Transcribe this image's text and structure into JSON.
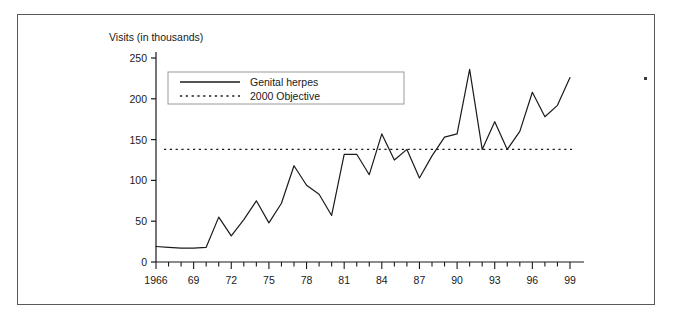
{
  "figure": {
    "background_color": "#ffffff",
    "frame_color": "#58595b",
    "line_color": "#1a1a1a"
  },
  "chart_data": {
    "type": "line",
    "title": "",
    "ylabel": "Visits (in thousands)",
    "xlabel": "",
    "ylim": [
      0,
      250
    ],
    "yticks": [
      0,
      50,
      100,
      150,
      200,
      250
    ],
    "xlim": [
      1966,
      1999
    ],
    "xticks": [
      1966,
      1969,
      1972,
      1975,
      1978,
      1981,
      1984,
      1987,
      1990,
      1993,
      1996,
      1999
    ],
    "xtick_labels": [
      "1966",
      "69",
      "72",
      "75",
      "78",
      "81",
      "84",
      "87",
      "90",
      "93",
      "96",
      "99"
    ],
    "minor_xticks_every": 1,
    "grid": false,
    "legend_position": "upper-left-inside",
    "x": [
      1966,
      1967,
      1968,
      1969,
      1970,
      1971,
      1972,
      1973,
      1974,
      1975,
      1976,
      1977,
      1978,
      1979,
      1980,
      1981,
      1982,
      1983,
      1984,
      1985,
      1986,
      1987,
      1988,
      1989,
      1990,
      1991,
      1992,
      1993,
      1994,
      1995,
      1996,
      1997,
      1998,
      1999
    ],
    "series": [
      {
        "name": "Genital herpes",
        "style": "solid",
        "values": [
          19,
          18,
          17,
          17,
          18,
          55,
          32,
          52,
          75,
          48,
          72,
          118,
          94,
          83,
          57,
          132,
          132,
          107,
          157,
          125,
          138,
          103,
          130,
          153,
          157,
          236,
          138,
          172,
          138,
          160,
          208,
          178,
          192,
          226
        ]
      },
      {
        "name": "2000 Objective",
        "style": "dotted",
        "constant_value": 138,
        "values": [
          138,
          138,
          138,
          138,
          138,
          138,
          138,
          138,
          138,
          138,
          138,
          138,
          138,
          138,
          138,
          138,
          138,
          138,
          138,
          138,
          138,
          138,
          138,
          138,
          138,
          138,
          138,
          138,
          138,
          138,
          138,
          138,
          138,
          138
        ]
      }
    ],
    "legend": [
      {
        "label": "Genital herpes",
        "style": "solid"
      },
      {
        "label": "2000 Objective",
        "style": "dotted"
      }
    ]
  }
}
